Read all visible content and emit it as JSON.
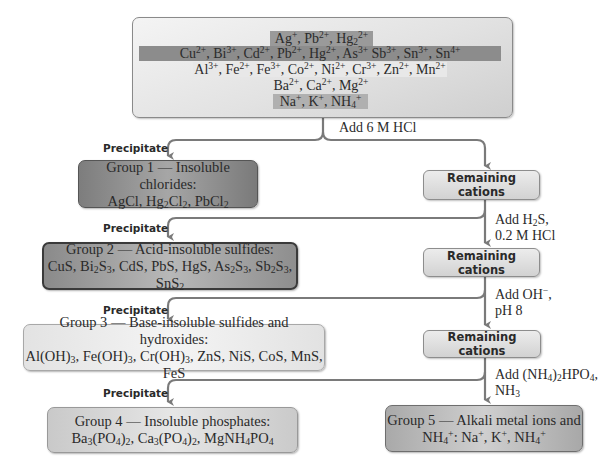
{
  "top_box": {
    "rows": [
      {
        "html": "Ag<sup>+</sup>, Pb<sup>2+</sup>, Hg<sub>2</sub><sup>2+</sup>",
        "text": "Ag+, Pb2+, Hg2 2+",
        "highlight": "#9a9a9a",
        "group": 1
      },
      {
        "html": "Cu<sup>2+</sup>, Bi<sup>3+</sup>, Cd<sup>2+</sup>, Pb<sup>2+</sup>, Hg<sup>2+</sup>, As<sup>3+</sup> Sb<sup>3+</sup>, Sn<sup>3+</sup>, Sn<sup>4+</sup>",
        "text": "Cu2+, Bi3+, Cd2+, Pb2+, Hg2+, As3+ Sb3+, Sn3+, Sn4+",
        "highlight": "#8c8c8c",
        "group": 2
      },
      {
        "html": "Al<sup>3+</sup>, Fe<sup>2+</sup>, Fe<sup>3+</sup>, Co<sup>2+</sup>, Ni<sup>2+</sup>, Cr<sup>3+</sup>, Zn<sup>2+</sup>, Mn<sup>2+</sup>",
        "text": "Al3+, Fe2+, Fe3+, Co2+, Ni2+, Cr3+, Zn2+, Mn2+",
        "highlight": "#e8e8e8",
        "group": 3
      },
      {
        "html": "Ba<sup>2+</sup>, Ca<sup>2+</sup>, Mg<sup>2+</sup>",
        "text": "Ba2+, Ca2+, Mg2+",
        "highlight": "#d6d6d6",
        "group": 4
      },
      {
        "html": "Na<sup>+</sup>, K<sup>+</sup>, NH<sub>4</sub><sup>+</sup>",
        "text": "Na+, K+, NH4+",
        "highlight": "#b0b0b0",
        "group": 5
      }
    ]
  },
  "reagents": [
    {
      "html": "Add 6 M HCl",
      "text": "Add 6 M HCl"
    },
    {
      "html": "Add H<sub>2</sub>S,<br>0.2 M HCl",
      "text": "Add H2S, 0.2 M HCl"
    },
    {
      "html": "Add OH<sup>&minus;</sup>,<br>pH 8",
      "text": "Add OH−, pH 8"
    },
    {
      "html": "Add (NH<sub>4</sub>)<sub>2</sub>HPO<sub>4</sub>,<br>NH<sub>3</sub>",
      "text": "Add (NH4)2HPO4, NH3"
    }
  ],
  "precipitate_label": "Precipitate",
  "remaining_label": "Remaining cations",
  "groups": [
    {
      "title": "Group 1 — Insoluble chlorides:",
      "formula_html": "AgCl, Hg<sub>2</sub>Cl<sub>2</sub>, PbCl<sub>2</sub>",
      "formula_text": "AgCl, Hg2Cl2, PbCl2"
    },
    {
      "title": "Group 2 — Acid-insoluble sulfides:",
      "formula_html": "CuS, Bi<sub>2</sub>S<sub>3</sub>, CdS, PbS, HgS, As<sub>2</sub>S<sub>3</sub>, Sb<sub>2</sub>S<sub>3</sub>, SnS<sub>2</sub>",
      "formula_text": "CuS, Bi2S3, CdS, PbS, HgS, As2S3, Sb2S3, SnS2"
    },
    {
      "title": "Group 3 — Base-insoluble sulfides and hydroxides:",
      "formula_html": "Al(OH)<sub>3</sub>, Fe(OH)<sub>3</sub>, Cr(OH)<sub>3</sub>, ZnS, NiS, CoS, MnS, FeS",
      "formula_text": "Al(OH)3, Fe(OH)3, Cr(OH)3, ZnS, NiS, CoS, MnS, FeS"
    },
    {
      "title": "Group 4 — Insoluble phosphates:",
      "formula_html": "Ba<sub>3</sub>(PO<sub>4</sub>)<sub>2</sub>, Ca<sub>3</sub>(PO<sub>4</sub>)<sub>2</sub>, MgNH<sub>4</sub>PO<sub>4</sub>",
      "formula_text": "Ba3(PO4)2, Ca3(PO4)2, MgNH4PO4"
    },
    {
      "title": "Group 5 — Alkali metal ions and",
      "formula_html": "NH<sub>4</sub><sup>+</sup>: Na<sup>+</sup>, K<sup>+</sup>, NH<sub>4</sub><sup>+</sup>",
      "formula_text": "NH4+: Na+, K+, NH4+"
    }
  ],
  "colors": {
    "line": "#7a7a7a",
    "text": "#2a2a2a"
  }
}
